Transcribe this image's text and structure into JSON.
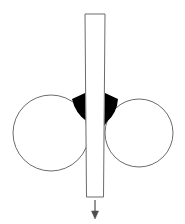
{
  "figure": {
    "title": "",
    "caption": "",
    "background_color": "#ffffff",
    "width": 185,
    "height": 224
  },
  "colors": {
    "outline": "#6b6b6b",
    "fill_white": "#ffffff",
    "wedge_black": "#000000",
    "arrow": "#4d4d4d"
  },
  "elements": {
    "left_roller": {
      "label": "",
      "shape": "circle",
      "cx": 51,
      "cy": 133,
      "r": 38,
      "fill": "#ffffff",
      "stroke": "#6b6b6b",
      "stroke_width": 1
    },
    "right_roller": {
      "label": "",
      "shape": "circle",
      "cx": 139,
      "cy": 133,
      "r": 34,
      "fill": "#ffffff",
      "stroke": "#6b6b6b",
      "stroke_width": 1
    },
    "vertical_strip": {
      "label": "",
      "shape": "quadrilateral",
      "top_left_x": 85,
      "top_right_x": 105,
      "bottom_left_x": 86.5,
      "bottom_right_x": 103.5,
      "top_y": 14,
      "bottom_y": 197,
      "fill": "#ffffff",
      "stroke": "#6b6b6b",
      "stroke_width": 1
    },
    "left_nip_wedge": {
      "label": "",
      "shape": "filled-fillet",
      "fill": "#000000",
      "top_y": 93,
      "bottom_y": 126,
      "outer_x": 72,
      "inner_x": 85
    },
    "right_nip_wedge": {
      "label": "",
      "shape": "filled-fillet",
      "fill": "#000000",
      "top_y": 93,
      "bottom_y": 126,
      "outer_x": 118,
      "inner_x": 105
    },
    "direction_arrow": {
      "label": "",
      "shape": "arrow-down",
      "x": 95,
      "start_y": 200,
      "end_y": 219,
      "stroke": "#4d4d4d",
      "stroke_width": 1,
      "head_width": 7,
      "head_height": 8
    }
  }
}
